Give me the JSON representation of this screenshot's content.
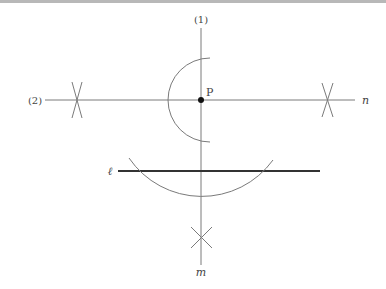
{
  "diagram": {
    "type": "geometric construction",
    "labels": {
      "step1": "(1)",
      "step2": "(2)",
      "point": "P",
      "line_n": "n",
      "line_l": "ℓ",
      "line_m": "m"
    },
    "colors": {
      "thin_line": "#7a7a7a",
      "thick_line": "#333333",
      "point": "#111111",
      "label": "#444444",
      "top_border": "#b8b8b8"
    }
  }
}
